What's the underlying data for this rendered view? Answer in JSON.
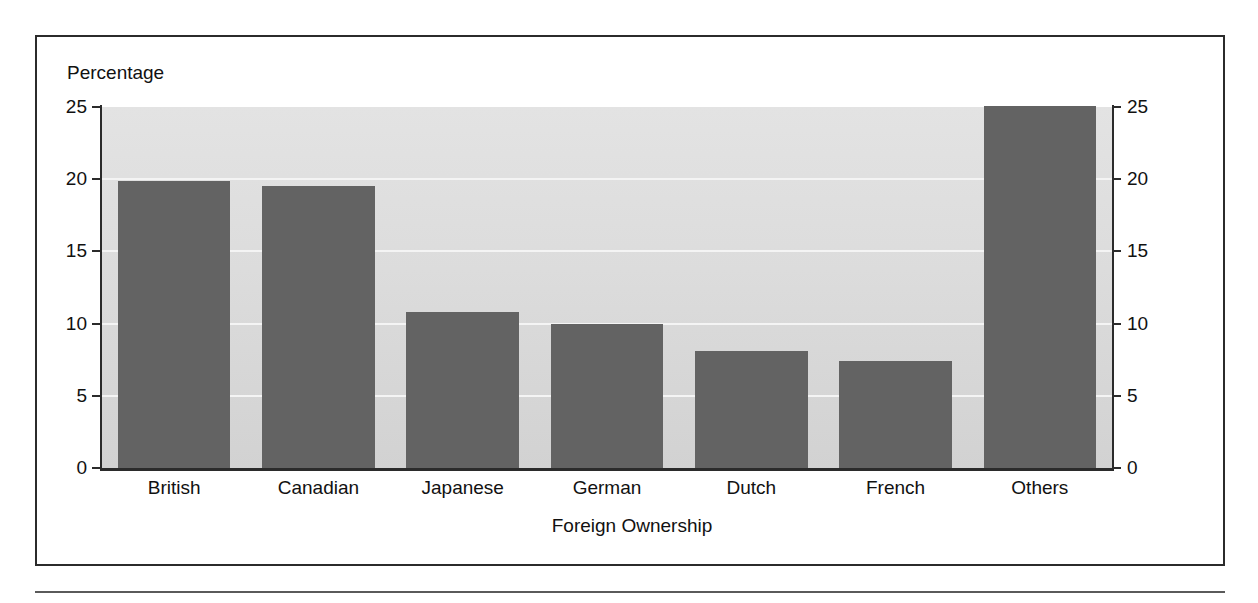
{
  "chart_data": {
    "type": "bar",
    "title": "",
    "categories": [
      "British",
      "Canadian",
      "Japanese",
      "German",
      "Dutch",
      "French",
      "Others"
    ],
    "values": [
      19.9,
      19.5,
      10.8,
      10.0,
      8.1,
      7.4,
      25.1
    ],
    "xlabel": "Foreign Ownership",
    "ylabel": "Percentage",
    "ylim": [
      0,
      25
    ],
    "yticks": [
      0,
      5,
      10,
      15,
      20,
      25
    ],
    "ytick_labels": [
      "0",
      "5",
      "10",
      "15",
      "20",
      "25"
    ],
    "right_axis": {
      "visible": true,
      "ticks": [
        0,
        5,
        10,
        15,
        20,
        25
      ],
      "tick_labels": [
        "0",
        "5",
        "10",
        "15",
        "20",
        "25"
      ]
    },
    "grid": true,
    "legend": null,
    "series": [
      {
        "name": "Percentage",
        "color": "#636363",
        "values": [
          19.9,
          19.5,
          10.8,
          10.0,
          8.1,
          7.4,
          25.1
        ]
      }
    ]
  },
  "colors": {
    "bar_fill": "#636363",
    "plot_background_top": "#e3e3e3",
    "plot_background_bottom": "#d2d2d2",
    "gridline": "#f4f4f4",
    "axis": "#2b2b2b",
    "text": "#111111",
    "frame_border": "#2b2b2b",
    "footer_rule": "#5a5a5a"
  }
}
